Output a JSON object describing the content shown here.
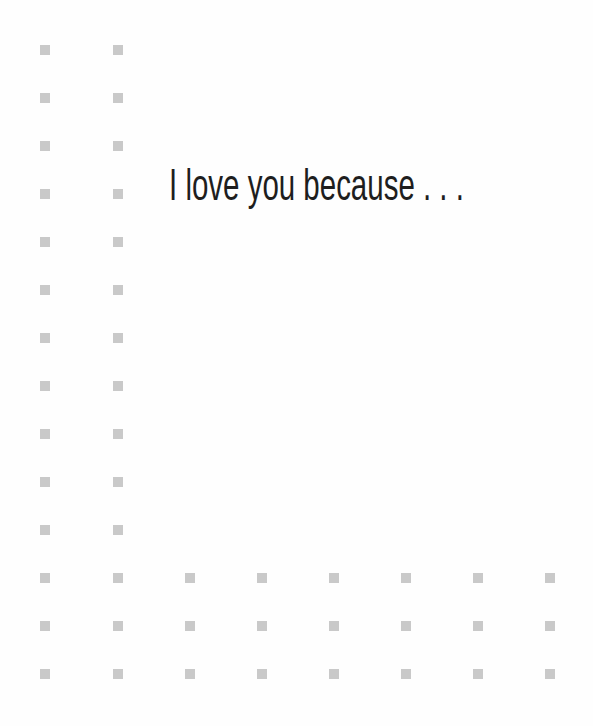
{
  "card": {
    "headline": "I love you because . . .",
    "colors": {
      "background": "#fefefe",
      "text": "#1e1e1e",
      "dot": "#c9c9c9"
    },
    "dot_grid": {
      "left_columns_x": [
        45,
        118
      ],
      "rows_y": [
        50,
        98,
        146,
        194,
        242,
        290,
        338,
        386,
        434,
        482,
        530,
        578,
        626,
        674
      ],
      "bottom_rows_y": [
        578,
        626,
        674
      ],
      "bottom_columns_x": [
        45,
        118,
        190,
        262,
        334,
        406,
        478,
        550
      ],
      "dot_size": 10
    }
  }
}
